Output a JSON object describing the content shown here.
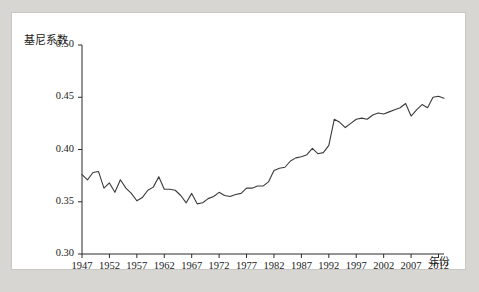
{
  "chart_data": {
    "type": "line",
    "title": "",
    "xlabel": "年份",
    "ylabel": "基尼系数",
    "ylim": [
      0.3,
      0.5
    ],
    "xlim": [
      1947,
      2013
    ],
    "grid": false,
    "legend": null,
    "ytick_labels": [
      "0.50",
      "0.45",
      "0.40",
      "0.35",
      "0.30"
    ],
    "ytick_values": [
      0.5,
      0.45,
      0.4,
      0.35,
      0.3
    ],
    "xtick_labels": [
      "1947",
      "1952",
      "1957",
      "1962",
      "1967",
      "1972",
      "1977",
      "1982",
      "1987",
      "1992",
      "1997",
      "2002",
      "2007",
      "2012"
    ],
    "xtick_values": [
      1947,
      1952,
      1957,
      1962,
      1967,
      1972,
      1977,
      1982,
      1987,
      1992,
      1997,
      2002,
      2007,
      2012
    ],
    "line_color": "#3a3a3a",
    "series": [
      {
        "name": "基尼系数",
        "x": [
          1947,
          1948,
          1949,
          1950,
          1951,
          1952,
          1953,
          1954,
          1955,
          1956,
          1957,
          1958,
          1959,
          1960,
          1961,
          1962,
          1963,
          1964,
          1965,
          1966,
          1967,
          1968,
          1969,
          1970,
          1971,
          1972,
          1973,
          1974,
          1975,
          1976,
          1977,
          1978,
          1979,
          1980,
          1981,
          1982,
          1983,
          1984,
          1985,
          1986,
          1987,
          1988,
          1989,
          1990,
          1991,
          1992,
          1993,
          1994,
          1995,
          1996,
          1997,
          1998,
          1999,
          2000,
          2001,
          2002,
          2003,
          2004,
          2005,
          2006,
          2007,
          2008,
          2009,
          2010,
          2011,
          2012,
          2013
        ],
        "values": [
          0.376,
          0.371,
          0.378,
          0.379,
          0.363,
          0.368,
          0.359,
          0.371,
          0.363,
          0.358,
          0.351,
          0.354,
          0.361,
          0.364,
          0.374,
          0.362,
          0.362,
          0.361,
          0.356,
          0.349,
          0.358,
          0.348,
          0.349,
          0.353,
          0.355,
          0.359,
          0.356,
          0.355,
          0.357,
          0.358,
          0.363,
          0.363,
          0.365,
          0.365,
          0.369,
          0.38,
          0.382,
          0.383,
          0.389,
          0.392,
          0.393,
          0.395,
          0.401,
          0.396,
          0.397,
          0.404,
          0.429,
          0.426,
          0.421,
          0.425,
          0.429,
          0.43,
          0.429,
          0.433,
          0.435,
          0.434,
          0.436,
          0.438,
          0.44,
          0.444,
          0.432,
          0.438,
          0.443,
          0.44,
          0.45,
          0.451,
          0.449
        ]
      }
    ]
  },
  "axis": {
    "y_label_text": "基尼系数",
    "x_label_text": "年份"
  }
}
